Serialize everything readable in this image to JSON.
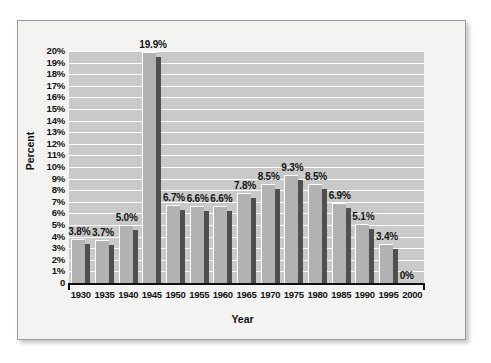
{
  "chart_data": {
    "type": "bar",
    "title": "",
    "xlabel": "Year",
    "ylabel": "Percent",
    "categories": [
      "1930",
      "1935",
      "1940",
      "1945",
      "1950",
      "1955",
      "1960",
      "1965",
      "1970",
      "1975",
      "1980",
      "1985",
      "1990",
      "1995",
      "2000"
    ],
    "values": [
      3.8,
      3.7,
      5.0,
      19.9,
      6.7,
      6.6,
      6.6,
      7.8,
      8.5,
      9.3,
      8.5,
      6.9,
      5.1,
      3.4,
      0
    ],
    "data_labels": [
      "3.8%",
      "3.7%",
      "5.0%",
      "19.9%",
      "6.7%",
      "6.6%",
      "6.6%",
      "7.8%",
      "8.5%",
      "9.3%",
      "8.5%",
      "6.9%",
      "5.1%",
      "3.4%",
      "0%"
    ],
    "ylim": [
      0,
      20
    ],
    "ytick_labels": [
      "20%",
      "19%",
      "18%",
      "17%",
      "16%",
      "15%",
      "14%",
      "13%",
      "12%",
      "11%",
      "10%",
      "9%",
      "8%",
      "7%",
      "6%",
      "5%",
      "4%",
      "3%",
      "2%",
      "1%",
      "0"
    ],
    "ytick_values": [
      20,
      19,
      18,
      17,
      16,
      15,
      14,
      13,
      12,
      11,
      10,
      9,
      8,
      7,
      6,
      5,
      4,
      3,
      2,
      1,
      0
    ],
    "grid": true,
    "legend": false,
    "series": [
      {
        "name": "Percent",
        "values": [
          3.8,
          3.7,
          5.0,
          19.9,
          6.7,
          6.6,
          6.6,
          7.8,
          8.5,
          9.3,
          8.5,
          6.9,
          5.1,
          3.4,
          0
        ]
      }
    ]
  },
  "colors": {
    "page_background": "#ffffff",
    "panel_background": "#f3f3f1",
    "panel_border": "#9a9a98",
    "plot_background": "#c9c9c9",
    "gridline": "#ffffff",
    "bar_front": "#b2b2b2",
    "bar_side": "#4f4f4f",
    "axis": "#101010",
    "text": "#141414"
  }
}
